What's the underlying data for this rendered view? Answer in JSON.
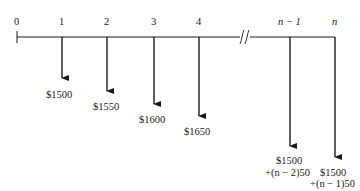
{
  "diagram": {
    "type": "cash-flow-diagram",
    "axis": {
      "periods": [
        {
          "label": "0",
          "x": 17
        },
        {
          "label": "1",
          "x": 62
        },
        {
          "label": "2",
          "x": 107
        },
        {
          "label": "3",
          "x": 154
        },
        {
          "label": "4",
          "x": 199
        },
        {
          "label": "n − 1",
          "x": 290
        },
        {
          "label": "n",
          "x": 335
        }
      ],
      "break_marker": "//"
    },
    "cash_flows": [
      {
        "period": "1",
        "amount": "$1500",
        "direction": "down"
      },
      {
        "period": "2",
        "amount": "$1550",
        "direction": "down"
      },
      {
        "period": "3",
        "amount": "$1600",
        "direction": "down"
      },
      {
        "period": "4",
        "amount": "$1650",
        "direction": "down"
      },
      {
        "period": "n − 1",
        "amount_line1": "$1500",
        "amount_line2": "+(n − 2)50",
        "direction": "down"
      },
      {
        "period": "n",
        "amount_line1": "$1500",
        "amount_line2": "+(n − 1)50",
        "direction": "down"
      }
    ]
  }
}
